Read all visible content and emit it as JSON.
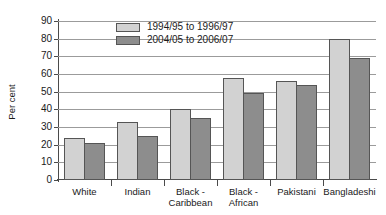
{
  "chart_data": {
    "type": "bar",
    "title": "",
    "xlabel": "",
    "ylabel": "Per cent",
    "ylim": [
      0,
      90
    ],
    "ytick_step": 10,
    "yticks": [
      90,
      80,
      70,
      60,
      50,
      40,
      30,
      20,
      10,
      0
    ],
    "grid": true,
    "legend_position": "top-left-inside",
    "categories": [
      "White",
      "Indian",
      "Black - Caribbean",
      "Black - African",
      "Pakistani",
      "Bangladeshi"
    ],
    "category_lines": [
      [
        "White"
      ],
      [
        "Indian"
      ],
      [
        "Black -",
        "Caribbean"
      ],
      [
        "Black -",
        "African"
      ],
      [
        "Pakistani"
      ],
      [
        "Bangladeshi"
      ]
    ],
    "series": [
      {
        "name": "1994/95 to 1996/97",
        "color": "#d2d2d2",
        "values": [
          24,
          33,
          40,
          57.5,
          56,
          80
        ]
      },
      {
        "name": "2004/05 to 2006/07",
        "color": "#8d8d8d",
        "values": [
          21,
          25,
          35,
          49.5,
          53.5,
          69
        ]
      }
    ]
  },
  "artifact": {
    "top_speckle": ""
  }
}
